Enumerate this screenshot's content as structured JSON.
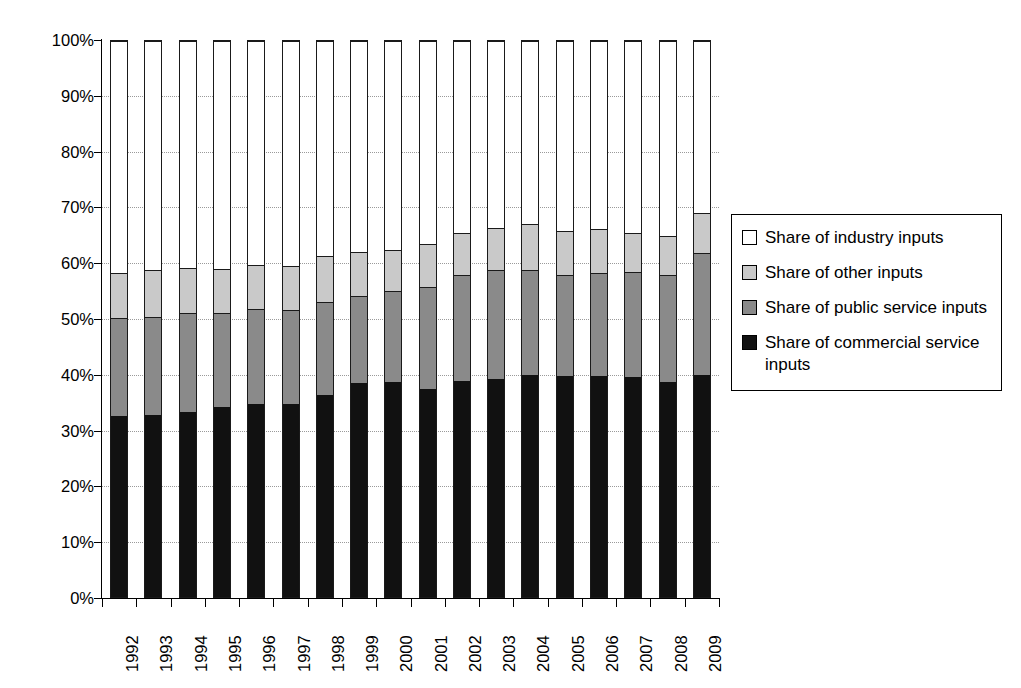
{
  "chart_data": {
    "type": "bar",
    "stacked": true,
    "stack_total": 100,
    "title": "",
    "subtitle": "",
    "xlabel": "",
    "ylabel": "",
    "ylim": [
      0,
      100
    ],
    "y_unit": "%",
    "grid": true,
    "grid_style": "dotted",
    "legend_position": "right",
    "categories": [
      "1992",
      "1993",
      "1994",
      "1995",
      "1996",
      "1997",
      "1998",
      "1999",
      "2000",
      "2001",
      "2002",
      "2003",
      "2004",
      "2005",
      "2006",
      "2007",
      "2008",
      "2009"
    ],
    "ytick_labels": [
      "100%",
      "90%",
      "80%",
      "70%",
      "60%",
      "50%",
      "40%",
      "30%",
      "20%",
      "10%",
      "0%"
    ],
    "ytick_values": [
      100,
      90,
      80,
      70,
      60,
      50,
      40,
      30,
      20,
      10,
      0
    ],
    "series": [
      {
        "name": "Share of commercial service inputs",
        "key": "commercial",
        "color": "#111111",
        "values": [
          32.5,
          32.7,
          33.2,
          34.1,
          34.7,
          34.8,
          36.3,
          38.5,
          38.6,
          37.5,
          38.8,
          39.2,
          40.0,
          39.7,
          39.8,
          39.6,
          38.6,
          40.0
        ]
      },
      {
        "name": "Share of public service inputs",
        "key": "public",
        "color": "#8a8a8a",
        "values": [
          17.7,
          17.6,
          17.8,
          17.0,
          17.1,
          16.8,
          16.7,
          15.7,
          16.4,
          18.2,
          19.1,
          19.6,
          18.9,
          18.2,
          18.5,
          18.8,
          19.3,
          21.9
        ]
      },
      {
        "name": "Share of other inputs",
        "key": "other",
        "color": "#c9c9c9",
        "values": [
          8.1,
          8.6,
          8.1,
          7.9,
          8.0,
          7.9,
          8.3,
          7.8,
          7.4,
          7.8,
          7.6,
          7.5,
          8.1,
          7.9,
          7.8,
          7.1,
          7.1,
          7.1
        ]
      },
      {
        "name": "Share of industry inputs",
        "key": "industry",
        "color": "#ffffff",
        "values": [
          41.7,
          41.1,
          40.9,
          41.0,
          40.2,
          40.5,
          38.7,
          38.0,
          37.6,
          36.5,
          34.5,
          33.7,
          33.0,
          34.2,
          33.9,
          34.5,
          35.0,
          31.0
        ]
      }
    ],
    "stack_tops": {
      "commercial": [
        32.5,
        32.7,
        33.2,
        34.1,
        34.7,
        34.8,
        36.3,
        38.5,
        38.6,
        37.5,
        38.8,
        39.2,
        40.0,
        39.7,
        39.8,
        39.6,
        38.6,
        40.0
      ],
      "public": [
        50.2,
        50.3,
        51.0,
        51.1,
        51.8,
        51.6,
        53.0,
        54.2,
        55.0,
        55.7,
        57.9,
        58.8,
        58.9,
        57.9,
        58.3,
        58.4,
        57.9,
        61.9
      ],
      "other": [
        58.3,
        58.9,
        59.1,
        59.0,
        59.8,
        59.5,
        61.3,
        62.0,
        62.4,
        63.5,
        65.5,
        66.3,
        67.0,
        65.8,
        66.1,
        65.5,
        65.0,
        69.0
      ],
      "industry": [
        100,
        100,
        100,
        100,
        100,
        100,
        100,
        100,
        100,
        100,
        100,
        100,
        100,
        100,
        100,
        100,
        100,
        100
      ]
    }
  },
  "legend": {
    "items": [
      {
        "label": "Share of industry inputs",
        "swatch": "white-swatch"
      },
      {
        "label": "Share of other inputs",
        "swatch": "light-gray-swatch"
      },
      {
        "label": "Share of public service inputs",
        "swatch": "medium-gray-swatch"
      },
      {
        "label": "Share of commercial service inputs",
        "swatch": "black-swatch"
      }
    ]
  }
}
